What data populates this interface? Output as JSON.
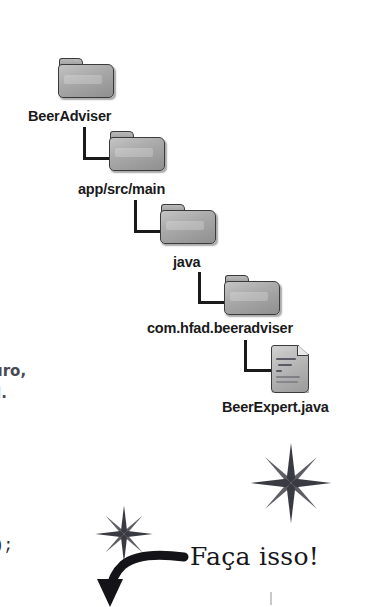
{
  "page": {
    "background_color": "#ffffff",
    "width": 380,
    "height": 607
  },
  "tree": {
    "title": "project folder hierarchy",
    "nodes": [
      {
        "label": "BeerAdviser",
        "type": "folder",
        "depth": 0
      },
      {
        "label": "app/src/main",
        "type": "folder",
        "depth": 1
      },
      {
        "label": "java",
        "type": "folder",
        "depth": 2
      },
      {
        "label": "com.hfad.beeradviser",
        "type": "folder",
        "depth": 3
      },
      {
        "label": "BeerExpert.java",
        "type": "file",
        "depth": 4
      }
    ],
    "icon_names": {
      "folder": "folder-icon",
      "file": "java-file-icon"
    },
    "colors": {
      "icon_fill": "#a8a8a8",
      "icon_stroke": "#3b3b3b",
      "label_color": "#1a1a1a",
      "connector_color": "#1a1a1a"
    }
  },
  "annotations": {
    "handwriting_fragment_1": "uro,",
    "handwriting_fragment_2": "l.",
    "code_fragment": ");",
    "callout": "Faça isso!",
    "handwriting_color": "#4a4a52",
    "callout_color": "#17171b"
  },
  "decorations": {
    "sparkle_large": "sparkle-star-icon",
    "sparkle_small": "sparkle-star-icon",
    "arrow": "curved-arrow-icon",
    "sparkle_color": "#3a3a42",
    "arrow_color": "#141418"
  }
}
